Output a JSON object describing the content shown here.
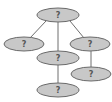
{
  "diagram": {
    "type": "tree",
    "node_fill": "#c8c8c8",
    "node_stroke": "#6a6a6a",
    "edge_color": "#6e6e6e",
    "nodes": [
      {
        "id": "root",
        "label": "?",
        "cx": 58,
        "cy": 15,
        "rx": 21,
        "ry": 7
      },
      {
        "id": "left",
        "label": "?",
        "cx": 24,
        "cy": 44,
        "rx": 20,
        "ry": 7
      },
      {
        "id": "middle",
        "label": "?",
        "cx": 58,
        "cy": 58,
        "rx": 21,
        "ry": 7
      },
      {
        "id": "right",
        "label": "?",
        "cx": 90,
        "cy": 44,
        "rx": 20,
        "ry": 7
      },
      {
        "id": "right-child",
        "label": "?",
        "cx": 91,
        "cy": 74,
        "rx": 20,
        "ry": 7
      },
      {
        "id": "middle-child",
        "label": "?",
        "cx": 58,
        "cy": 90,
        "rx": 21,
        "ry": 7
      }
    ],
    "edges": [
      {
        "from": "root",
        "to": "left"
      },
      {
        "from": "root",
        "to": "middle"
      },
      {
        "from": "root",
        "to": "right"
      },
      {
        "from": "middle",
        "to": "middle-child"
      },
      {
        "from": "right",
        "to": "right-child"
      }
    ]
  }
}
